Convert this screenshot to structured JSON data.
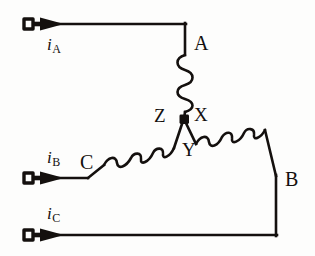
{
  "figure": {
    "background_color": "#fdfdfc",
    "ink_color": "#14100e"
  },
  "terminals": [
    {
      "id": "A",
      "label": "A",
      "current_symbol": "i",
      "current_subscript": "A"
    },
    {
      "id": "B",
      "label": "B",
      "current_symbol": "i",
      "current_subscript": "B"
    },
    {
      "id": "C",
      "label": "C",
      "current_symbol": "i",
      "current_subscript": "C"
    }
  ],
  "winding_ends": [
    {
      "id": "X",
      "label": "X"
    },
    {
      "id": "Y",
      "label": "Y"
    },
    {
      "id": "Z",
      "label": "Z"
    }
  ],
  "labels": {
    "A": "A",
    "B": "B",
    "C": "C",
    "X": "X",
    "Y": "Y",
    "Z": "Z",
    "i_symbol": "i",
    "sub_A": "A",
    "sub_B": "B",
    "sub_C": "C"
  },
  "nodes": {
    "center": {
      "name": "common-junction",
      "x": 184,
      "y": 120,
      "marker": "filled-square"
    }
  },
  "coils": [
    {
      "name": "coil-A-X",
      "from": "A",
      "to": "X",
      "bumps": 4,
      "orientation": "vertical"
    },
    {
      "name": "coil-C-Z",
      "from": "C",
      "to": "Z",
      "bumps": 4,
      "orientation": "diagonal-up-right"
    },
    {
      "name": "coil-Y-B",
      "from": "Y",
      "to": "B",
      "bumps": 4,
      "orientation": "diagonal-down-right"
    }
  ],
  "arrows": [
    {
      "name": "current-arrow-a",
      "x": 30,
      "y": 24,
      "direction": "right"
    },
    {
      "name": "current-arrow-b",
      "x": 30,
      "y": 172,
      "direction": "right"
    },
    {
      "name": "current-arrow-c",
      "x": 30,
      "y": 235,
      "direction": "right"
    }
  ]
}
